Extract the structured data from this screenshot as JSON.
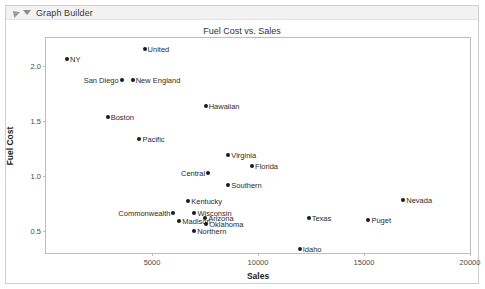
{
  "window": {
    "title": "Graph Builder",
    "disclosure_icon": "triangle-collapse-icon",
    "menu_icon": "chevron-down-icon"
  },
  "chart_data": {
    "type": "scatter",
    "title": "Fuel Cost vs. Sales",
    "xlabel": "Sales",
    "ylabel": "Fuel Cost",
    "xlim": [
      0,
      20000
    ],
    "ylim": [
      0.3,
      2.25
    ],
    "xticks": [
      5000,
      10000,
      15000,
      20000
    ],
    "yticks": [
      0.5,
      1.0,
      1.5,
      2.0
    ],
    "grid": false,
    "legend": "none",
    "point_color": "#1b1b1b",
    "points": [
      {
        "label": "NY",
        "x": 990,
        "y": 2.06,
        "anchor": "right"
      },
      {
        "label": "United",
        "x": 4650,
        "y": 2.15,
        "anchor": "right"
      },
      {
        "label": "San Diego",
        "x": 3570,
        "y": 1.87,
        "anchor": "left"
      },
      {
        "label": "New England",
        "x": 4090,
        "y": 1.87,
        "anchor": "right"
      },
      {
        "label": "Hawaiian",
        "x": 7530,
        "y": 1.63,
        "anchor": "right"
      },
      {
        "label": "Boston",
        "x": 2910,
        "y": 1.53,
        "anchor": "right"
      },
      {
        "label": "Pacific",
        "x": 4410,
        "y": 1.33,
        "anchor": "right"
      },
      {
        "label": "Virginia",
        "x": 8600,
        "y": 1.19,
        "anchor": "right"
      },
      {
        "label": "Florida",
        "x": 9720,
        "y": 1.09,
        "anchor": "right"
      },
      {
        "label": "Central",
        "x": 7650,
        "y": 1.03,
        "anchor": "left"
      },
      {
        "label": "Southern",
        "x": 8600,
        "y": 0.92,
        "anchor": "right"
      },
      {
        "label": "Kentucky",
        "x": 6710,
        "y": 0.77,
        "anchor": "right"
      },
      {
        "label": "Commonwealth",
        "x": 6010,
        "y": 0.66,
        "anchor": "left"
      },
      {
        "label": "Wisconsin",
        "x": 7000,
        "y": 0.66,
        "anchor": "right"
      },
      {
        "label": "Madison",
        "x": 6290,
        "y": 0.59,
        "anchor": "right"
      },
      {
        "label": "Arizona",
        "x": 7510,
        "y": 0.62,
        "anchor": "right"
      },
      {
        "label": "Oklahoma",
        "x": 7560,
        "y": 0.56,
        "anchor": "right"
      },
      {
        "label": "Northern",
        "x": 6990,
        "y": 0.5,
        "anchor": "right"
      },
      {
        "label": "Texas",
        "x": 12390,
        "y": 0.62,
        "anchor": "right"
      },
      {
        "label": "Puget",
        "x": 15210,
        "y": 0.6,
        "anchor": "right"
      },
      {
        "label": "Nevada",
        "x": 16850,
        "y": 0.78,
        "anchor": "right"
      },
      {
        "label": "Idaho",
        "x": 11970,
        "y": 0.34,
        "anchor": "right"
      }
    ]
  }
}
